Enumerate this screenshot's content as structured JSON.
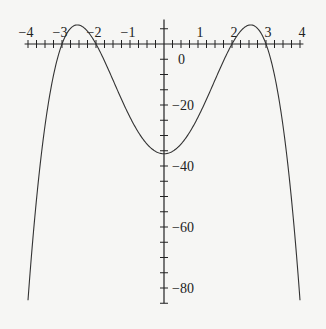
{
  "chart_data": {
    "type": "line",
    "title": "",
    "xlabel": "",
    "ylabel": "",
    "function": "y = -(x^2-4)(x^2-9) = -x^4 + 13x^2 - 36",
    "xlim": [
      -4,
      4
    ],
    "ylim": [
      -84,
      6.25
    ],
    "x_ticks": [
      -4,
      -3,
      -2,
      -1,
      1,
      2,
      3,
      4
    ],
    "x_tick_labels": [
      "−4",
      "−3",
      "−2",
      "−1",
      "1",
      "2",
      "3",
      "4"
    ],
    "y_ticks": [
      0,
      -20,
      -40,
      -60,
      -80
    ],
    "y_tick_labels": [
      "0",
      "−20",
      "−40",
      "−60",
      "−80"
    ],
    "minor_x_step": 0.25,
    "minor_y_step": 5,
    "grid": false,
    "legend": null,
    "series": [
      {
        "name": "f(x)",
        "x": [
          -4,
          -3.5,
          -3,
          -2.5,
          -2,
          -1.5,
          -1,
          -0.5,
          0,
          0.5,
          1,
          1.5,
          2,
          2.5,
          3,
          3.5,
          4
        ],
        "values": [
          -84,
          -33.75,
          0,
          6.25,
          0,
          -11.81,
          -24,
          -32.81,
          -36,
          -32.81,
          -24,
          -11.81,
          0,
          6.25,
          0,
          -33.75,
          -84
        ]
      }
    ],
    "key_points": {
      "roots": [
        -3,
        -2,
        2,
        3
      ],
      "local_maxima": [
        [
          -2.55,
          6.25
        ],
        [
          2.55,
          6.25
        ]
      ],
      "local_minimum": [
        0,
        -36
      ]
    }
  },
  "style": {
    "curve_color": "#333333",
    "axis_color": "#222222",
    "background": "#f6f6f4"
  }
}
